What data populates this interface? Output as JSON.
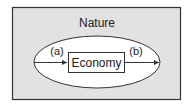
{
  "diagram": {
    "outer_label": "Nature",
    "inner_label": "Economy",
    "flow_in_label": "(a)",
    "flow_out_label": "(b)",
    "colors": {
      "outer_fill": "#e2e2e2",
      "inner_fill": "#ffffff",
      "stroke": "#333333"
    }
  }
}
